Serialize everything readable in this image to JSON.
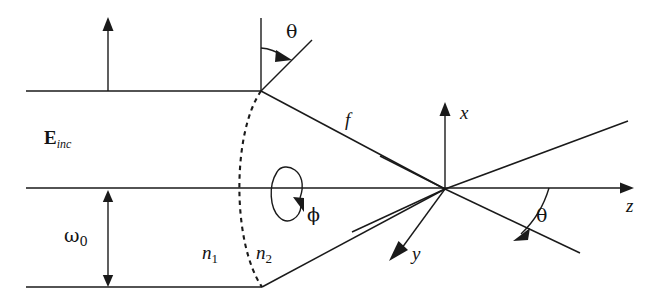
{
  "figure": {
    "domain": "diagram",
    "kind": "optical-focusing-geometry",
    "background_color": "#ffffff",
    "stroke_color": "#1a1a1a",
    "width": 652,
    "height": 305
  },
  "labels": {
    "e_inc_symbol": "E",
    "e_inc_subscript": "inc",
    "theta_top": "θ",
    "theta_focus": "θ",
    "phi": "ϕ",
    "focal_length": "f",
    "omega_symbol": "ω",
    "omega_subscript": "0",
    "n1_symbol": "n",
    "n1_subscript": "1",
    "n2_symbol": "n",
    "n2_subscript": "2",
    "axis_x": "x",
    "axis_y": "y",
    "axis_z": "z"
  },
  "geometry": {
    "beam_top_y": 91,
    "beam_bottom_y": 287,
    "optical_axis_y": 188,
    "beam_left_x": 26,
    "lens_top_vertex": [
      261,
      91
    ],
    "lens_bottom_vertex": [
      262,
      287
    ],
    "focus_point": [
      445,
      189
    ],
    "e_inc_arrow_x": 108,
    "omega_arrow_x": 108,
    "z_axis_end_x": 628,
    "x_axis_top_y": 102
  }
}
